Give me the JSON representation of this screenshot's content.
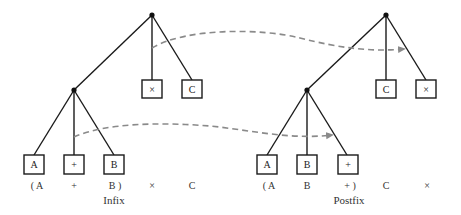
{
  "diagram": {
    "type": "expression-tree-comparison",
    "colors": {
      "line": "#1a1a1a",
      "dashed_arrow": "#8a8a8a",
      "text": "#333333"
    },
    "infix": {
      "caption": "Infix",
      "root_children": [
        "×",
        "C"
      ],
      "subtree_children": [
        "A",
        "+",
        "B"
      ],
      "sequence": [
        "( A",
        "+",
        "B )",
        "×",
        "C"
      ]
    },
    "postfix": {
      "caption": "Postfix",
      "root_children": [
        "C",
        "×"
      ],
      "subtree_children": [
        "A",
        "B",
        "+"
      ],
      "sequence": [
        "( A",
        "B",
        "+ )",
        "C",
        "×"
      ]
    },
    "arrows": [
      {
        "from": "infix root operator ×",
        "to": "postfix root operator ×"
      },
      {
        "from": "infix subtree operator +",
        "to": "postfix subtree operator +"
      }
    ]
  }
}
